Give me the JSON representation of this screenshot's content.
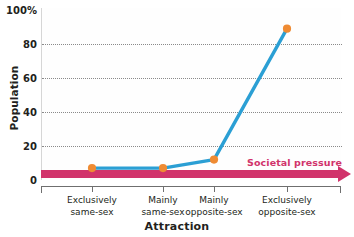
{
  "chart_data": {
    "type": "line",
    "title": "",
    "xlabel": "Attraction",
    "ylabel": "Population",
    "categories": [
      "Exclusively same-sex",
      "Mainly same-sex",
      "Mainly opposite-sex",
      "Exclusively opposite-sex"
    ],
    "category_lines": [
      [
        "Exclusively",
        "same-sex"
      ],
      [
        "Mainly",
        "same-sex"
      ],
      [
        "Mainly",
        "opposite-sex"
      ],
      [
        "Exclusively",
        "opposite-sex"
      ]
    ],
    "values": [
      7,
      7,
      12,
      89
    ],
    "series": [
      {
        "name": "Population",
        "values": [
          7,
          7,
          12,
          89
        ],
        "line_color": "#2b9fd4",
        "marker_color": "#ef8b33"
      }
    ],
    "ylim": [
      0,
      100
    ],
    "xlim": [
      0,
      3
    ],
    "yticks": [
      0,
      20,
      40,
      60,
      80,
      100
    ],
    "ytick_labels": [
      "0",
      "20",
      "40",
      "60",
      "80",
      "100%"
    ],
    "gridlines": [
      20,
      40,
      60,
      80
    ],
    "grid": true,
    "grid_style": "dotted",
    "legend": "none",
    "annotations": [
      {
        "text": "Societal pressure",
        "type": "arrow",
        "direction": "right",
        "color": "#d1336b"
      }
    ]
  },
  "axes": {
    "y": {
      "label": "Population",
      "ticks": [
        {
          "label": "100%",
          "value": 100
        },
        {
          "label": "80",
          "value": 80
        },
        {
          "label": "60",
          "value": 60
        },
        {
          "label": "40",
          "value": 40
        },
        {
          "label": "20",
          "value": 20
        },
        {
          "label": "0",
          "value": 0
        }
      ]
    },
    "x": {
      "label": "Attraction"
    }
  },
  "colors": {
    "line": "#2b9fd4",
    "marker": "#ef8b33",
    "pressure": "#d1336b",
    "grid": "#8a8a8a",
    "axis": "#6f6f6f",
    "text": "#231f20",
    "background": "#ffffff"
  }
}
